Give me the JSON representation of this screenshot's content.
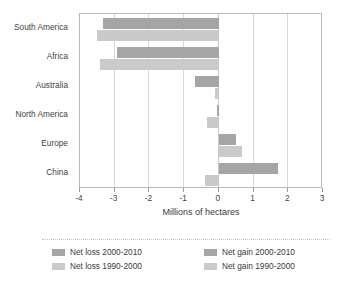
{
  "chart_data": {
    "type": "bar",
    "orientation": "horizontal",
    "title": "",
    "xlabel": "Millions of hectares",
    "ylabel": "",
    "xlim": [
      -4,
      3
    ],
    "xticks": [
      -4,
      -3,
      -2,
      -1,
      0,
      1,
      2,
      3
    ],
    "xtick_labels": [
      "-4",
      "-3",
      "-2",
      "-1",
      "0",
      "1",
      "2",
      "3"
    ],
    "grid": true,
    "grid_axis": "x",
    "legend_position": "bottom",
    "categories": [
      "South America",
      "Africa",
      "Australia",
      "North America",
      "Europe",
      "China"
    ],
    "series": [
      {
        "name": "Net loss 2000-2010",
        "color": "#a5a5a5",
        "values": [
          -3.35,
          -2.92,
          -0.68,
          -0.05,
          0,
          0
        ]
      },
      {
        "name": "Net loss 1990-2000",
        "color": "#cacaca",
        "values": [
          -3.52,
          -3.42,
          -0.12,
          -0.33,
          0,
          -0.4
        ]
      },
      {
        "name": "Net gain 2000-2010",
        "color": "#a5a5a5",
        "values": [
          0,
          0,
          0,
          0,
          0.5,
          1.7
        ]
      },
      {
        "name": "Net gain 1990-2000",
        "color": "#cacaca",
        "values": [
          0,
          0,
          0,
          0,
          0.66,
          0
        ]
      }
    ],
    "bars": [
      {
        "category": "South America",
        "series": "Net loss 2000-2010",
        "value": -3.35
      },
      {
        "category": "South America",
        "series": "Net loss 1990-2000",
        "value": -3.52
      },
      {
        "category": "Africa",
        "series": "Net loss 2000-2010",
        "value": -2.92
      },
      {
        "category": "Africa",
        "series": "Net loss 1990-2000",
        "value": -3.42
      },
      {
        "category": "Australia",
        "series": "Net loss 2000-2010",
        "value": -0.68
      },
      {
        "category": "Australia",
        "series": "Net loss 1990-2000",
        "value": -0.12
      },
      {
        "category": "North America",
        "series": "Net loss 2000-2010",
        "value": -0.05
      },
      {
        "category": "North America",
        "series": "Net loss 1990-2000",
        "value": -0.33
      },
      {
        "category": "Europe",
        "series": "Net gain 2000-2010",
        "value": 0.5
      },
      {
        "category": "Europe",
        "series": "Net gain 1990-2000",
        "value": 0.66
      },
      {
        "category": "China",
        "series": "Net gain 2000-2010",
        "value": 1.7
      },
      {
        "category": "China",
        "series": "Net loss 1990-2000",
        "value": -0.4
      }
    ]
  },
  "axis": {
    "xlabel": "Millions of hectares",
    "tick_labels": [
      "-4",
      "-3",
      "-2",
      "-1",
      "0",
      "1",
      "2",
      "3"
    ]
  },
  "categories": [
    {
      "label": "South America"
    },
    {
      "label": "Africa"
    },
    {
      "label": "Australia"
    },
    {
      "label": "North America"
    },
    {
      "label": "Europe"
    },
    {
      "label": "China"
    }
  ],
  "legend": {
    "items": [
      {
        "label": "Net loss 2000-2010",
        "color": "#a5a5a5"
      },
      {
        "label": "Net gain 2000-2010",
        "color": "#a5a5a5"
      },
      {
        "label": "Net loss 1990-2000",
        "color": "#cacaca"
      },
      {
        "label": "Net gain 1990-2000",
        "color": "#cacaca"
      }
    ]
  },
  "colors": {
    "dark_bar": "#a5a5a5",
    "light_bar": "#cacaca",
    "gridline": "#d8d8d8",
    "frame": "#b9b9b9",
    "text": "#3a3a3a"
  }
}
